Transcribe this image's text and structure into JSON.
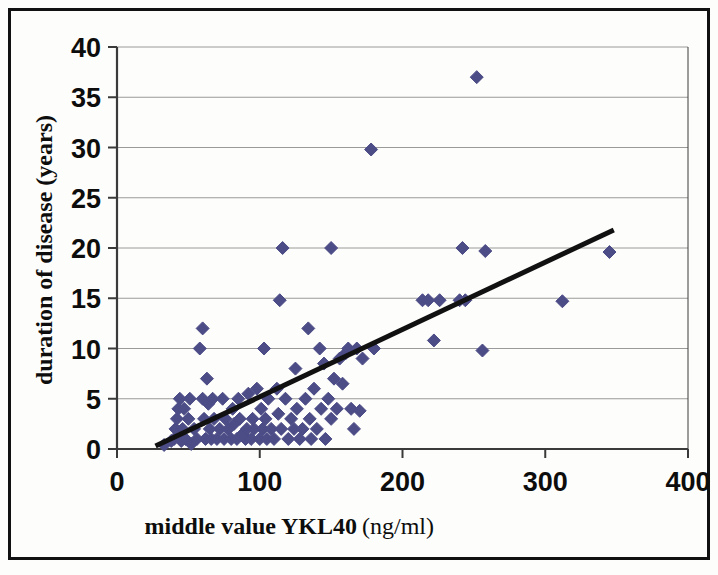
{
  "figure": {
    "background_color": "#fdfdfb",
    "frame_color": "#111111",
    "marker_color": "#4c4c87",
    "trendline_color": "#111111",
    "gridline_color": "#9a9a9a",
    "axis_color": "#3a3a3a"
  },
  "chart_data": {
    "type": "scatter",
    "title": "",
    "xlabel_main": "middle value  YKL40",
    "xlabel_units": "(ng/ml)",
    "xlabel": "middle value  YKL40 (ng/ml)",
    "ylabel": "duration of disease (years)",
    "xlim": [
      0,
      400
    ],
    "ylim": [
      0,
      40
    ],
    "xticks": [
      0,
      100,
      200,
      300,
      400
    ],
    "xtick_labels": [
      "0",
      "100",
      "200",
      "300",
      "400"
    ],
    "yticks": [
      0,
      5,
      10,
      15,
      20,
      25,
      30,
      35,
      40
    ],
    "ytick_labels": [
      "0",
      "5",
      "10",
      "15",
      "20",
      "25",
      "30",
      "35",
      "40"
    ],
    "grid": "horizontal",
    "legend": "none",
    "marker": "diamond",
    "marker_size_px": 13,
    "series": [
      {
        "name": "patients",
        "points": [
          [
            33,
            0.4
          ],
          [
            38,
            0.8
          ],
          [
            40,
            1.0
          ],
          [
            41,
            2.0
          ],
          [
            42,
            3.0
          ],
          [
            43,
            4.0
          ],
          [
            44,
            5.0
          ],
          [
            45,
            0.8
          ],
          [
            46,
            2.0
          ],
          [
            47,
            4.0
          ],
          [
            48,
            1.0
          ],
          [
            50,
            3.0
          ],
          [
            51,
            5.0
          ],
          [
            52,
            0.5
          ],
          [
            54,
            2.0
          ],
          [
            56,
            1.0
          ],
          [
            58,
            10.0
          ],
          [
            60,
            12.0
          ],
          [
            60,
            5.0
          ],
          [
            61,
            3.0
          ],
          [
            62,
            1.0
          ],
          [
            63,
            7.0
          ],
          [
            64,
            4.5
          ],
          [
            65,
            2.0
          ],
          [
            66,
            1.0
          ],
          [
            67,
            5.0
          ],
          [
            68,
            3.0
          ],
          [
            70,
            1.0
          ],
          [
            72,
            2.0
          ],
          [
            74,
            5.0
          ],
          [
            75,
            1.0
          ],
          [
            76,
            3.0
          ],
          [
            78,
            2.0
          ],
          [
            80,
            1.0
          ],
          [
            81,
            4.0
          ],
          [
            82,
            2.5
          ],
          [
            84,
            1.0
          ],
          [
            85,
            5.0
          ],
          [
            86,
            3.0
          ],
          [
            88,
            1.5
          ],
          [
            90,
            1.0
          ],
          [
            91,
            2.0
          ],
          [
            92,
            5.5
          ],
          [
            94,
            1.0
          ],
          [
            95,
            3.0
          ],
          [
            96,
            2.0
          ],
          [
            98,
            6.0
          ],
          [
            100,
            1.0
          ],
          [
            101,
            4.0
          ],
          [
            102,
            2.0
          ],
          [
            103,
            10.0
          ],
          [
            104,
            3.0
          ],
          [
            105,
            1.0
          ],
          [
            106,
            5.0
          ],
          [
            108,
            2.0
          ],
          [
            110,
            1.0
          ],
          [
            112,
            6.0
          ],
          [
            113,
            3.5
          ],
          [
            114,
            14.8
          ],
          [
            115,
            2.0
          ],
          [
            116,
            20.0
          ],
          [
            118,
            5.0
          ],
          [
            120,
            1.0
          ],
          [
            122,
            3.0
          ],
          [
            124,
            2.0
          ],
          [
            125,
            8.0
          ],
          [
            126,
            4.0
          ],
          [
            128,
            1.0
          ],
          [
            130,
            2.0
          ],
          [
            132,
            5.0
          ],
          [
            134,
            12.0
          ],
          [
            135,
            3.0
          ],
          [
            136,
            1.0
          ],
          [
            138,
            6.0
          ],
          [
            140,
            2.0
          ],
          [
            142,
            10.0
          ],
          [
            143,
            4.0
          ],
          [
            145,
            8.5
          ],
          [
            146,
            1.0
          ],
          [
            148,
            5.0
          ],
          [
            150,
            20.0
          ],
          [
            150,
            3.0
          ],
          [
            152,
            7.0
          ],
          [
            154,
            4.0
          ],
          [
            156,
            9.0
          ],
          [
            158,
            6.5
          ],
          [
            160,
            9.5
          ],
          [
            162,
            10.0
          ],
          [
            164,
            4.0
          ],
          [
            166,
            2.0
          ],
          [
            168,
            10.0
          ],
          [
            170,
            3.8
          ],
          [
            172,
            9.0
          ],
          [
            178,
            29.8
          ],
          [
            180,
            10.0
          ],
          [
            214,
            14.8
          ],
          [
            218,
            14.8
          ],
          [
            222,
            10.8
          ],
          [
            226,
            14.8
          ],
          [
            240,
            14.8
          ],
          [
            242,
            20.0
          ],
          [
            244,
            14.8
          ],
          [
            252,
            37.0
          ],
          [
            256,
            9.8
          ],
          [
            258,
            19.7
          ],
          [
            312,
            14.7
          ],
          [
            345,
            19.6
          ]
        ]
      }
    ],
    "trendline": {
      "name": "linear fit",
      "x_start": 27,
      "y_start": 0.3,
      "x_end": 348,
      "y_end": 21.8,
      "width_px": 5
    }
  }
}
